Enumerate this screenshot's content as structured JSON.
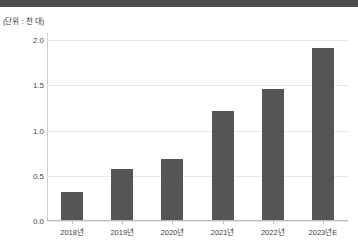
{
  "figure": {
    "background_color": "#ffffff",
    "banner_color": "#4d4d4d",
    "unit_label": "(단위 : 천 대)"
  },
  "chart_data": {
    "type": "bar",
    "title": "",
    "subtitle": "",
    "unit_note": "(단위 : 천 대)",
    "xlabel": "",
    "ylabel": "",
    "categories": [
      "2018년",
      "2019년",
      "2020년",
      "2021년",
      "2022년",
      "2023년E"
    ],
    "values": [
      0.31,
      0.56,
      0.67,
      1.21,
      1.45,
      1.9
    ],
    "ylim": [
      0.0,
      2.08
    ],
    "yticks": [
      0.0,
      0.5,
      1.0,
      1.5,
      2.0
    ],
    "ytick_labels": [
      "0.0",
      "0.5",
      "1.0",
      "1.5",
      "2.0"
    ],
    "grid": true,
    "grid_axis": "y",
    "grid_color": "#e9e9e9",
    "legend": null,
    "legend_position": "none",
    "bar_color": "#555555",
    "bar_width_px": 22,
    "annotations": []
  }
}
